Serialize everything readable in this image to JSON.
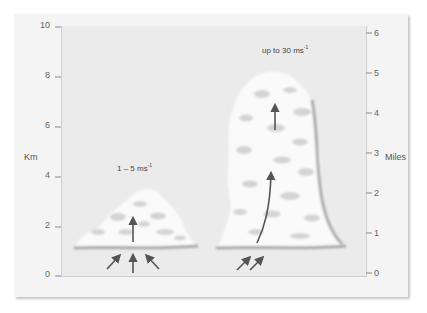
{
  "diagram": {
    "title": "",
    "left_axis": {
      "title": "Km",
      "ticks": [
        "10",
        "8",
        "6",
        "4",
        "2",
        "0"
      ]
    },
    "right_axis": {
      "title": "Miles",
      "ticks": [
        "6",
        "5",
        "4",
        "3",
        "2",
        "1",
        "0"
      ]
    },
    "clouds": [
      {
        "name": "cumulus-small",
        "speed_label": "1 – 5 ms",
        "speed_unit_exp": "-1"
      },
      {
        "name": "cumulonimbus-tall",
        "speed_label": "up to 30 ms",
        "speed_unit_exp": "-1"
      }
    ],
    "colors": {
      "panel": "#f4f4f4",
      "plot_bg": "#ebebeb",
      "cloud": "#fafafa",
      "cloud_shade": "#d6d6d6",
      "arrow": "#555555"
    }
  }
}
